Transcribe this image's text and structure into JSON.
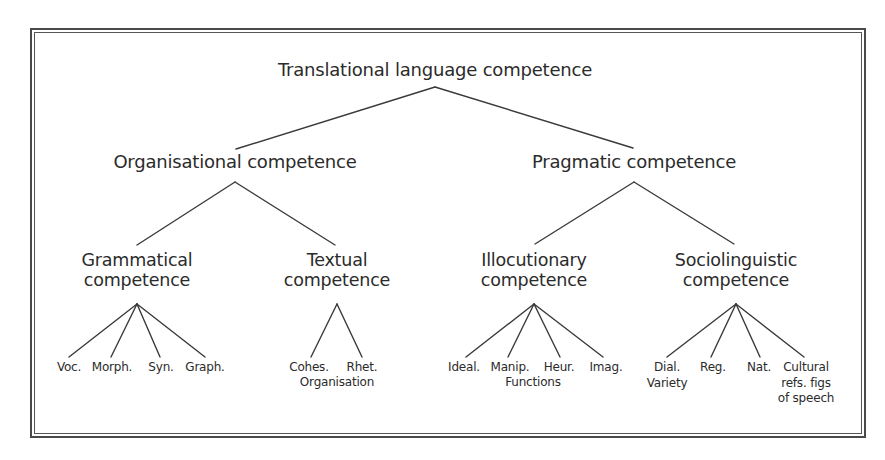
{
  "diagram": {
    "type": "tree",
    "root": {
      "label": "Translational language competence"
    },
    "level1": [
      {
        "label": "Organisational competence"
      },
      {
        "label": "Pragmatic competence"
      }
    ],
    "level2": [
      {
        "line1": "Grammatical",
        "line2": "competence",
        "parent": "Organisational competence"
      },
      {
        "line1": "Textual",
        "line2": "competence",
        "parent": "Organisational competence"
      },
      {
        "line1": "Illocutionary",
        "line2": "competence",
        "parent": "Pragmatic competence"
      },
      {
        "line1": "Sociolinguistic",
        "line2": "competence",
        "parent": "Pragmatic competence"
      }
    ],
    "leaves": {
      "grammatical": [
        "Voc.",
        "Morph.",
        "Syn.",
        "Graph."
      ],
      "textual": [
        "Cohes.",
        "Rhet."
      ],
      "textual_group_label": "Organisation",
      "illocutionary": [
        "Ideal.",
        "Manip.",
        "Heur.",
        "Imag."
      ],
      "illocutionary_group_label": "Functions",
      "sociolinguistic": [
        "Dial.",
        "Reg.",
        "Nat.",
        "Cultural"
      ],
      "sociolinguistic_dial_line2": "Variety",
      "sociolinguistic_cultural_line2": "refs. figs",
      "sociolinguistic_cultural_line3": "of speech"
    },
    "colors": {
      "line": "#3a3a3a",
      "text": "#2b2b2b",
      "frame": "#4a4a4a",
      "background": "#ffffff"
    }
  }
}
